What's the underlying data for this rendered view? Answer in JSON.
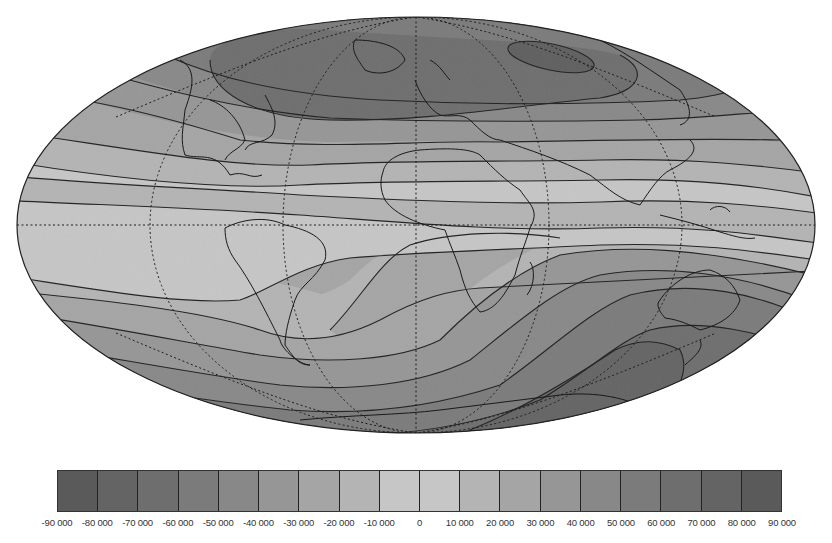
{
  "figure": {
    "projection": "Hammer-Aitoff (equal-area ellipse)",
    "central_meridian": 0,
    "graticule": {
      "style": "dotted",
      "meridian_spacing_deg": 60,
      "parallel_spacing_deg": 60,
      "equator": "dotted"
    },
    "coastlines": true,
    "shading": "grayscale, darker = larger magnitude",
    "contour_interval": 10000
  },
  "colorbar": {
    "ticks": [
      "-90 000",
      "-80 000",
      "-70 000",
      "-60 000",
      "-50 000",
      "-40 000",
      "-30 000",
      "-20 000",
      "-10 000",
      "0",
      "10 000",
      "20 000",
      "30 000",
      "40 000",
      "50 000",
      "60 000",
      "70 000",
      "80 000",
      "90 000"
    ],
    "bins": [
      {
        "range": [
          -90000,
          -80000
        ],
        "color": "#5a5a5a"
      },
      {
        "range": [
          -80000,
          -70000
        ],
        "color": "#646464"
      },
      {
        "range": [
          -70000,
          -60000
        ],
        "color": "#6e6e6e"
      },
      {
        "range": [
          -60000,
          -50000
        ],
        "color": "#7b7b7b"
      },
      {
        "range": [
          -50000,
          -40000
        ],
        "color": "#888888"
      },
      {
        "range": [
          -40000,
          -30000
        ],
        "color": "#969696"
      },
      {
        "range": [
          -30000,
          -20000
        ],
        "color": "#a5a5a5"
      },
      {
        "range": [
          -20000,
          -10000
        ],
        "color": "#b4b4b4"
      },
      {
        "range": [
          -10000,
          0
        ],
        "color": "#c6c6c6"
      },
      {
        "range": [
          0,
          10000
        ],
        "color": "#c6c6c6"
      },
      {
        "range": [
          10000,
          20000
        ],
        "color": "#b4b4b4"
      },
      {
        "range": [
          20000,
          30000
        ],
        "color": "#a5a5a5"
      },
      {
        "range": [
          30000,
          40000
        ],
        "color": "#969696"
      },
      {
        "range": [
          40000,
          50000
        ],
        "color": "#888888"
      },
      {
        "range": [
          50000,
          60000
        ],
        "color": "#7b7b7b"
      },
      {
        "range": [
          60000,
          70000
        ],
        "color": "#6e6e6e"
      },
      {
        "range": [
          70000,
          80000
        ],
        "color": "#646464"
      },
      {
        "range": [
          80000,
          90000
        ],
        "color": "#5a5a5a"
      }
    ]
  },
  "chart_data": {
    "type": "heatmap",
    "title": "",
    "value_range": [
      -90000,
      90000
    ],
    "contour_levels": [
      -80000,
      -70000,
      -60000,
      -50000,
      -40000,
      -30000,
      -20000,
      -10000,
      0,
      10000,
      20000,
      30000,
      40000,
      50000,
      60000,
      70000,
      80000
    ],
    "features": [
      {
        "name": "northern maximum magnitude",
        "location": "northern Canada / Siberia",
        "approx_value": "50000–60000 band, closed contour over Siberia"
      },
      {
        "name": "zero line (magnetic equator)",
        "location": "crosses Atlantic near Brazil, dips south over South America, runs north of equator over Africa/Asia"
      },
      {
        "name": "southern maximum magnitude",
        "location": "south of Australia / Antarctica coast",
        "approx_value": "-60000 to -70000 band, closed contour"
      },
      {
        "name": "South Atlantic region",
        "location": "South Atlantic / southern Africa",
        "approx_value": "-20000 to -30000"
      }
    ],
    "colorbar_ticks": [
      -90000,
      -80000,
      -70000,
      -60000,
      -50000,
      -40000,
      -30000,
      -20000,
      -10000,
      0,
      10000,
      20000,
      30000,
      40000,
      50000,
      60000,
      70000,
      80000,
      90000
    ]
  }
}
